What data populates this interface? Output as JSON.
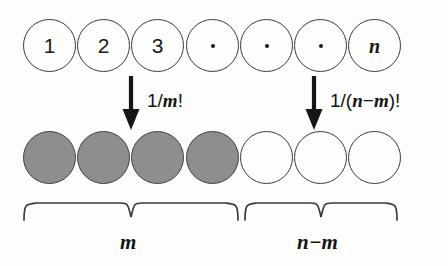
{
  "figure": {
    "colors": {
      "background": "#fdfdfc",
      "outline": "#3a3a3a",
      "fill_gray": "#8e8e8e",
      "ink": "#141414"
    }
  },
  "top_row": {
    "name": "labelled-ball-row",
    "balls": [
      {
        "label": "1",
        "kind": "text",
        "filled": false
      },
      {
        "label": "2",
        "kind": "text",
        "filled": false
      },
      {
        "label": "3",
        "kind": "text",
        "filled": false
      },
      {
        "label": "·",
        "kind": "dot",
        "filled": false
      },
      {
        "label": "·",
        "kind": "dot",
        "filled": false
      },
      {
        "label": "·",
        "kind": "dot",
        "filled": false
      },
      {
        "label": "n",
        "kind": "mathit",
        "filled": false
      }
    ]
  },
  "bottom_row": {
    "name": "partitioned-ball-row",
    "balls": [
      {
        "label": "",
        "kind": "blank",
        "filled": true
      },
      {
        "label": "",
        "kind": "blank",
        "filled": true
      },
      {
        "label": "",
        "kind": "blank",
        "filled": true
      },
      {
        "label": "",
        "kind": "blank",
        "filled": true
      },
      {
        "label": "",
        "kind": "blank",
        "filled": false
      },
      {
        "label": "",
        "kind": "blank",
        "filled": false
      },
      {
        "label": "",
        "kind": "blank",
        "filled": false
      }
    ]
  },
  "arrows": [
    {
      "name": "arrow-left",
      "icon": "down-arrow-icon",
      "caption_parts": {
        "lead": "1/",
        "var1": "m",
        "tail": "!"
      },
      "caption_text": "1/m!"
    },
    {
      "name": "arrow-right",
      "icon": "down-arrow-icon",
      "caption_parts": {
        "lead": "1/(",
        "var1": "n",
        "op": "−",
        "var2": "m",
        "tail": ")!"
      },
      "caption_text": "1/(n−m)!"
    }
  ],
  "braces": [
    {
      "name": "brace-left",
      "label": "m"
    },
    {
      "name": "brace-right",
      "label": "n−m"
    }
  ]
}
